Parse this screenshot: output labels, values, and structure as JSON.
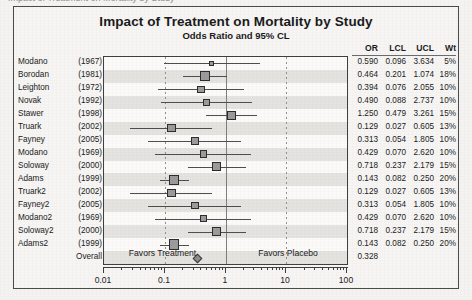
{
  "page": {
    "top_sliver_text": "Impact of Treatment on Mortality by Study"
  },
  "chart_data": {
    "type": "forest",
    "title": "Impact of Treatment on Mortality by Study",
    "subtitle": "Odds Ratio and 95% CL",
    "xlabel": "",
    "ylabel": "",
    "xscale": "log",
    "xlim": [
      0.01,
      100
    ],
    "grid": true,
    "reference_line": 1,
    "axis_ticks": [
      "0.01",
      "0.1",
      "1",
      "10",
      "100"
    ],
    "axis_tick_values": [
      0.01,
      0.1,
      1,
      10,
      100
    ],
    "columns": [
      "OR",
      "LCL",
      "UCL",
      "Wt"
    ],
    "favors_left": "Favors Treatment",
    "favors_right": "Favors Placebo",
    "marker_color": "#9b9b9b",
    "marker_edge_color": "#2d2d2d",
    "line_color": "#4e4e4e",
    "stripe_color": "#e4e3e0",
    "rows": [
      {
        "name": "Modano",
        "year": "(1967)",
        "or": "0.590",
        "lcl": "0.096",
        "ucl": "3.634",
        "wt": "5%",
        "or_v": 0.59,
        "lcl_v": 0.096,
        "ucl_v": 3.634,
        "wt_v": 5
      },
      {
        "name": "Borodan",
        "year": "(1981)",
        "or": "0.464",
        "lcl": "0.201",
        "ucl": "1.074",
        "wt": "18%",
        "or_v": 0.464,
        "lcl_v": 0.201,
        "ucl_v": 1.074,
        "wt_v": 18
      },
      {
        "name": "Leighton",
        "year": "(1972)",
        "or": "0.394",
        "lcl": "0.076",
        "ucl": "2.055",
        "wt": "10%",
        "or_v": 0.394,
        "lcl_v": 0.076,
        "ucl_v": 2.055,
        "wt_v": 10
      },
      {
        "name": "Novak",
        "year": "(1992)",
        "or": "0.490",
        "lcl": "0.088",
        "ucl": "2.737",
        "wt": "10%",
        "or_v": 0.49,
        "lcl_v": 0.088,
        "ucl_v": 2.737,
        "wt_v": 10
      },
      {
        "name": "Stawer",
        "year": "(1998)",
        "or": "1.250",
        "lcl": "0.479",
        "ucl": "3.261",
        "wt": "15%",
        "or_v": 1.25,
        "lcl_v": 0.479,
        "ucl_v": 3.261,
        "wt_v": 15
      },
      {
        "name": "Truark",
        "year": "(2002)",
        "or": "0.129",
        "lcl": "0.027",
        "ucl": "0.605",
        "wt": "13%",
        "or_v": 0.129,
        "lcl_v": 0.027,
        "ucl_v": 0.605,
        "wt_v": 13
      },
      {
        "name": "Fayney",
        "year": "(2005)",
        "or": "0.313",
        "lcl": "0.054",
        "ucl": "1.805",
        "wt": "10%",
        "or_v": 0.313,
        "lcl_v": 0.054,
        "ucl_v": 1.805,
        "wt_v": 10
      },
      {
        "name": "Modano",
        "year": "(1969)",
        "or": "0.429",
        "lcl": "0.070",
        "ucl": "2.620",
        "wt": "10%",
        "or_v": 0.429,
        "lcl_v": 0.07,
        "ucl_v": 2.62,
        "wt_v": 10
      },
      {
        "name": "Soloway",
        "year": "(2000)",
        "or": "0.718",
        "lcl": "0.237",
        "ucl": "2.179",
        "wt": "15%",
        "or_v": 0.718,
        "lcl_v": 0.237,
        "ucl_v": 2.179,
        "wt_v": 15
      },
      {
        "name": "Adams",
        "year": "(1999)",
        "or": "0.143",
        "lcl": "0.082",
        "ucl": "0.250",
        "wt": "20%",
        "or_v": 0.143,
        "lcl_v": 0.082,
        "ucl_v": 0.25,
        "wt_v": 20
      },
      {
        "name": "Truark2",
        "year": "(2002)",
        "or": "0.129",
        "lcl": "0.027",
        "ucl": "0.605",
        "wt": "13%",
        "or_v": 0.129,
        "lcl_v": 0.027,
        "ucl_v": 0.605,
        "wt_v": 13
      },
      {
        "name": "Fayney2",
        "year": "(2005)",
        "or": "0.313",
        "lcl": "0.054",
        "ucl": "1.805",
        "wt": "10%",
        "or_v": 0.313,
        "lcl_v": 0.054,
        "ucl_v": 1.805,
        "wt_v": 10
      },
      {
        "name": "Modano2",
        "year": "(1969)",
        "or": "0.429",
        "lcl": "0.070",
        "ucl": "2.620",
        "wt": "10%",
        "or_v": 0.429,
        "lcl_v": 0.07,
        "ucl_v": 2.62,
        "wt_v": 10
      },
      {
        "name": "Soloway2",
        "year": "(2000)",
        "or": "0.718",
        "lcl": "0.237",
        "ucl": "2.179",
        "wt": "15%",
        "or_v": 0.718,
        "lcl_v": 0.237,
        "ucl_v": 2.179,
        "wt_v": 15
      },
      {
        "name": "Adams2",
        "year": "(1999)",
        "or": "0.143",
        "lcl": "0.082",
        "ucl": "0.250",
        "wt": "20%",
        "or_v": 0.143,
        "lcl_v": 0.082,
        "ucl_v": 0.25,
        "wt_v": 20
      },
      {
        "name": "Overall",
        "year": "",
        "or": "0.328",
        "lcl": "",
        "ucl": "",
        "wt": "",
        "or_v": 0.328,
        "lcl_v": null,
        "ucl_v": null,
        "wt_v": null,
        "summary": true
      }
    ]
  }
}
